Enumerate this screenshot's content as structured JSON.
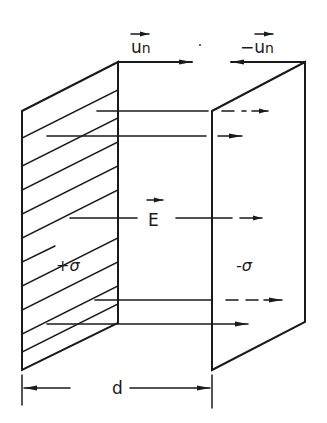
{
  "diagram": {
    "colors": {
      "ink": "#1a1a1a",
      "background": "#ffffff"
    },
    "labels": {
      "unit_normal_left": "u",
      "unit_normal_left_sub": "n",
      "unit_normal_right_sign": "−",
      "unit_normal_right": "u",
      "unit_normal_right_sub": "n",
      "field": "E",
      "left_charge": "+σ",
      "right_charge": "-σ",
      "separation": "d"
    },
    "plates": [
      {
        "name": "positive-plate",
        "charge": "+σ",
        "hatched": true,
        "corners": [
          [
            22,
            111
          ],
          [
            118,
            62
          ],
          [
            118,
            323
          ],
          [
            22,
            370
          ]
        ]
      },
      {
        "name": "negative-plate",
        "charge": "-σ",
        "hatched": false,
        "corners": [
          [
            212,
            111
          ],
          [
            305,
            62
          ],
          [
            305,
            322
          ],
          [
            212,
            370
          ]
        ]
      }
    ],
    "field_lines_y": [
      111,
      136,
      218,
      300,
      324
    ],
    "dimension": {
      "from_x": 22,
      "to_x": 212,
      "y": 388,
      "label": "d"
    }
  }
}
